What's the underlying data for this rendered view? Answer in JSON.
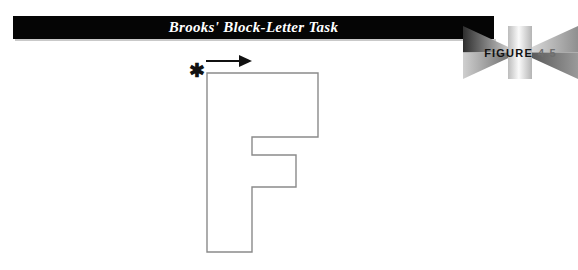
{
  "banner": {
    "title": "Brooks' Block-Letter Task",
    "background_color": "#050505",
    "text_color": "#ffffff"
  },
  "figure_badge": {
    "word": "FIGURE",
    "number": "4.5",
    "word_color": "#111111",
    "number_color": "#6e6e6e"
  },
  "diagram": {
    "letter": "F",
    "outline_color": "#8a8a8a",
    "fill_color": "#ffffff",
    "start_marker": "✱",
    "start_marker_name": "asterisk-start-point",
    "direction_arrow": "arrow-right",
    "arrow_color": "#111111"
  }
}
